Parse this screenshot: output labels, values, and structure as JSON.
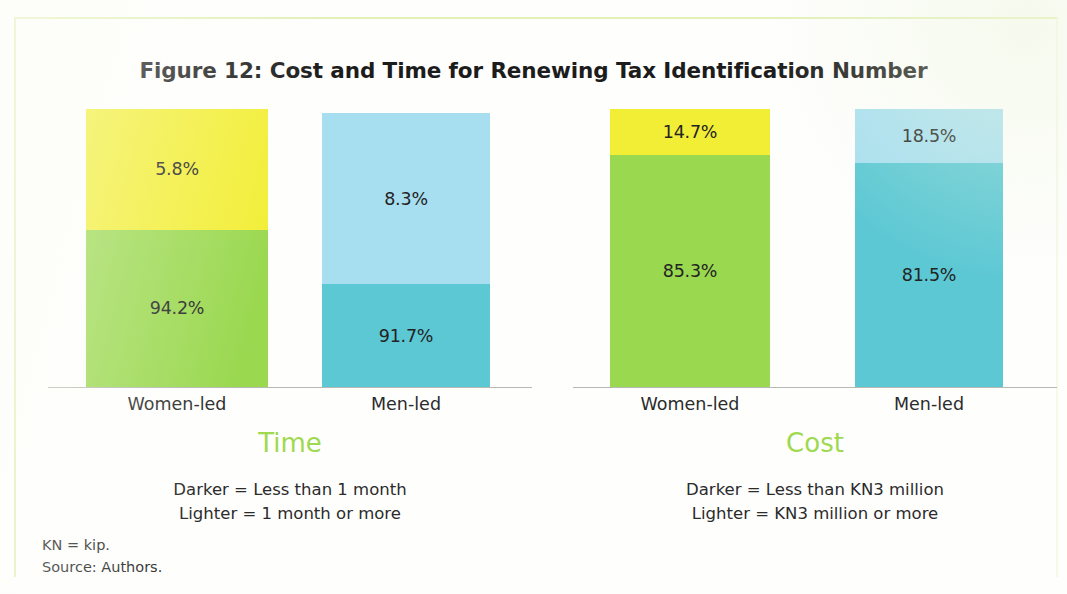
{
  "figure": {
    "title": "Figure 12: Cost and Time for Renewing Tax Identification Number"
  },
  "footnotes": {
    "abbreviation": "KN = kip.",
    "source": "Source: Authors."
  },
  "colors": {
    "women_lighter": "#f2ee36",
    "women_darker": "#9ad84f",
    "men_lighter": "#a8dff0",
    "men_darker": "#5cc8d4",
    "caption_green": "#9ed94f",
    "axis": "#b9b9b4",
    "text": "#232323",
    "frame": "#e2f0b8"
  },
  "panels": [
    {
      "id": "time",
      "caption": "Time",
      "legend_line1": "Darker = Less than 1 month",
      "legend_line2": "Lighter = 1 month or more",
      "categories": [
        "Women-led",
        "Men-led"
      ],
      "bars": [
        {
          "category": "Women-led",
          "lighter_label": "5.8%",
          "darker_label": "94.2%",
          "lighter_value": 5.8,
          "darker_value": 94.2,
          "lighter_color": "#f2ee36",
          "darker_color": "#9ad84f",
          "drawn_lighter_fraction": 0.435,
          "drawn_total_fraction": 1.0
        },
        {
          "category": "Men-led",
          "lighter_label": "8.3%",
          "darker_label": "91.7%",
          "lighter_value": 8.3,
          "darker_value": 91.7,
          "lighter_color": "#a8dff0",
          "darker_color": "#5cc8d4",
          "drawn_lighter_fraction": 0.625,
          "drawn_total_fraction": 0.985
        }
      ]
    },
    {
      "id": "cost",
      "caption": "Cost",
      "legend_line1": "Darker = Less than KN3 million",
      "legend_line2": "Lighter = KN3 million or more",
      "categories": [
        "Women-led",
        "Men-led"
      ],
      "bars": [
        {
          "category": "Women-led",
          "lighter_label": "14.7%",
          "darker_label": "85.3%",
          "lighter_value": 14.7,
          "darker_value": 85.3,
          "lighter_color": "#f2ee36",
          "darker_color": "#9ad84f",
          "drawn_lighter_fraction": 0.164,
          "drawn_total_fraction": 1.0
        },
        {
          "category": "Men-led",
          "lighter_label": "18.5%",
          "darker_label": "81.5%",
          "lighter_value": 18.5,
          "darker_value": 81.5,
          "lighter_color": "#a8dff0",
          "darker_color": "#5cc8d4",
          "drawn_lighter_fraction": 0.194,
          "drawn_total_fraction": 1.0
        }
      ]
    }
  ],
  "chart_data": {
    "type": "bar",
    "title": "Figure 12: Cost and Time for Renewing Tax Identification Number",
    "subtitle": "",
    "xlabel": "",
    "ylabel": "",
    "stacked": true,
    "normalized_percent": true,
    "ylim": [
      0,
      100
    ],
    "grid": false,
    "legend_position": "below-panel-as-text",
    "panels": [
      {
        "name": "Time",
        "categories": [
          "Women-led",
          "Men-led"
        ],
        "series": [
          {
            "name": "Darker = Less than 1 month",
            "values": [
              94.2,
              91.7
            ]
          },
          {
            "name": "Lighter = 1 month or more",
            "values": [
              5.8,
              8.3
            ]
          }
        ],
        "data_labels": [
          [
            "94.2%",
            "91.7%"
          ],
          [
            "5.8%",
            "8.3%"
          ]
        ]
      },
      {
        "name": "Cost",
        "categories": [
          "Women-led",
          "Men-led"
        ],
        "series": [
          {
            "name": "Darker = Less than KN3 million",
            "values": [
              85.3,
              81.5
            ]
          },
          {
            "name": "Lighter = KN3 million or more",
            "values": [
              14.7,
              18.5
            ]
          }
        ],
        "data_labels": [
          [
            "85.3%",
            "81.5%"
          ],
          [
            "14.7%",
            "18.5%"
          ]
        ]
      }
    ],
    "annotations": [
      "KN = kip.",
      "Source: Authors."
    ]
  }
}
